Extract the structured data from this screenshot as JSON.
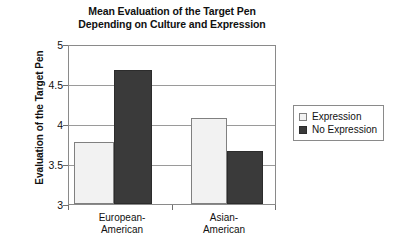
{
  "chart_data": {
    "type": "bar",
    "title": "Mean Evaluation of the Target Pen Depending on Culture and Expression",
    "title_lines": [
      "Mean Evaluation of the Target Pen",
      "Depending on Culture and Expression"
    ],
    "xlabel": "",
    "ylabel": "Evaluation of the Target Pen",
    "ylim": [
      3,
      5
    ],
    "ytick_values": [
      3,
      3.5,
      4,
      4.5,
      5
    ],
    "ytick_labels": [
      "3",
      "3.5",
      "4",
      "4.5",
      "5"
    ],
    "grid": true,
    "legend_position": "right",
    "categories": [
      "European-American",
      "Asian-American"
    ],
    "category_label_lines": [
      [
        "European-",
        "American"
      ],
      [
        "Asian-",
        "American"
      ]
    ],
    "series": [
      {
        "name": "Expression",
        "color": "#f2f2f2",
        "border_color": "#808080",
        "values": [
          3.78,
          4.09
        ]
      },
      {
        "name": "No Expression",
        "color": "#3a3a3a",
        "border_color": "#2c2c2c",
        "values": [
          4.69,
          3.67
        ]
      }
    ]
  }
}
